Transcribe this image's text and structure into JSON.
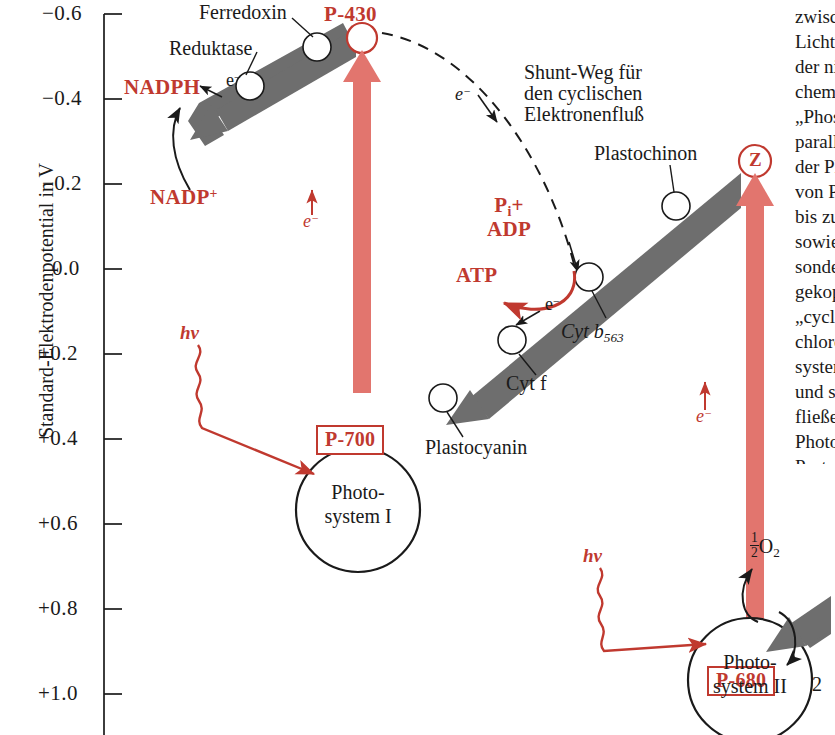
{
  "figure": {
    "kind": "z-scheme-photosynthesis-diagram",
    "language": "de",
    "colors": {
      "red": "#c0392f",
      "red_arrow": "#e2756e",
      "gray_arrow": "#6e6e6e",
      "black": "#1a1a1a",
      "background": "#ffffff"
    }
  },
  "axis": {
    "title": "Standard-Elektrodenpotential in V",
    "ticks": [
      "−0.6",
      "−0.4",
      "−0.2",
      "0.0",
      "+0.2",
      "+0.4",
      "+0.6",
      "+0.8",
      "+1.0"
    ],
    "tick_values": [
      -0.6,
      -0.4,
      -0.2,
      0.0,
      0.2,
      0.4,
      0.6,
      0.8,
      1.0
    ]
  },
  "chart_data": {
    "type": "diagram",
    "ylabel": "Standard-Elektrodenpotential in V",
    "ylim": [
      -0.6,
      1.0
    ],
    "y_ticks": [
      -0.6,
      -0.4,
      -0.2,
      0.0,
      0.2,
      0.4,
      0.6,
      0.8,
      1.0
    ],
    "grid": false,
    "legend": "none",
    "nodes": [
      {
        "name": "P-430",
        "potential": -0.55,
        "style": "red-circle"
      },
      {
        "name": "Ferredoxin",
        "potential": -0.47,
        "style": "open-circle"
      },
      {
        "name": "Reduktase",
        "potential": -0.39,
        "style": "open-circle"
      },
      {
        "name": "NADPH",
        "potential": -0.33,
        "style": "red-text"
      },
      {
        "name": "NADP⁺",
        "potential": -0.18,
        "style": "red-text"
      },
      {
        "name": "P-700",
        "potential": 0.42,
        "style": "red-box"
      },
      {
        "name": "Plastocyanin",
        "potential": 0.37,
        "style": "open-circle"
      },
      {
        "name": "Cyt f",
        "potential": 0.31,
        "style": "open-circle"
      },
      {
        "name": "Cyt b563",
        "potential": 0.06,
        "style": "open-circle"
      },
      {
        "name": "Plastochinon",
        "potential": 0.01,
        "style": "open-circle"
      },
      {
        "name": "Z",
        "potential": 0.02,
        "style": "red-circle"
      },
      {
        "name": "P-680",
        "potential": 0.99,
        "style": "red-box"
      }
    ],
    "photosystems": [
      {
        "name": "Photosystem I",
        "reaction_centre": "P-700"
      },
      {
        "name": "Photosystem II",
        "reaction_centre": "P-680"
      }
    ],
    "transitions": [
      {
        "from": "P-700",
        "to": "P-430",
        "kind": "light-excitation",
        "carrier": "e⁻"
      },
      {
        "from": "P-680",
        "to": "Z",
        "kind": "light-excitation",
        "carrier": "e⁻"
      },
      {
        "from": "P-430",
        "to": "NADPH",
        "kind": "downhill-transport"
      },
      {
        "from": "Z",
        "to": "P-700",
        "kind": "downhill-transport"
      },
      {
        "from": "P-430",
        "to": "Cyt b563",
        "kind": "cyclic-shunt"
      }
    ]
  },
  "labels": {
    "ferredoxin": "Ferredoxin",
    "reduktase": "Reduktase",
    "nadph": "NADPH",
    "nadp_plus": "NADP",
    "nadp_plus_sup": "+",
    "p430": "P-430",
    "p700": "P-700",
    "p680": "P-680",
    "z": "Z",
    "plastochinon": "Plastochinon",
    "plastocyanin": "Plastocyanin",
    "cyt_f": "Cyt f",
    "cyt_b": "Cyt",
    "cyt_b_italic": "b",
    "cyt_b_sub": "563",
    "atp": "ATP",
    "pi_label": "P",
    "pi_sub": "i",
    "pi_plus": "+",
    "adp": "ADP",
    "electron": "e",
    "electron_sup": "−",
    "hv": "hν",
    "half_o2_num": "1",
    "half_o2_den": "2",
    "half_o2_text": "O",
    "half_o2_sub": "2",
    "two": "2",
    "shunt_line1": "Shunt-Weg für",
    "shunt_line2": "den cyclischen",
    "shunt_line3": "Elektronenfluß",
    "photosystem1_line1": "Photo-",
    "photosystem1_line2": "system I",
    "photosystem2_line1": "Photo-",
    "photosystem2_line2": "system II"
  },
  "side_column": {
    "note": "angeschnittene Textspalte am rechten Rand",
    "lines": [
      "zwischen den beiden",
      "Lichtreaktionen liegt",
      "der nichtcyclische",
      "chemiosmotische",
      "„Phosphorylierung“",
      "paralleler Elektronen-",
      "der Plastochinon-",
      "von Photosystem II",
      "bis zum Photosystem I",
      "sowie der damit ge-",
      "sondere Bedeutung",
      "gekoppelte ATP-",
      "„cyclischen“ Elektro-",
      "chlorophyll des",
      "system I zurück-",
      "und so einen in sich",
      "fließenden Elektronen-",
      "Photosystem II",
      "Protonengradient",
      "NADPH gebildet"
    ]
  }
}
